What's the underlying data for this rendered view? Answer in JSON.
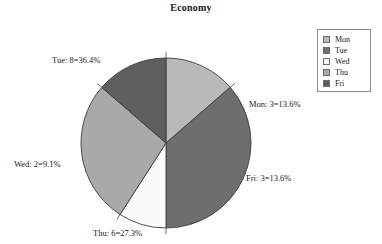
{
  "chart_data": {
    "type": "pie",
    "title": "Economy",
    "categories": [
      "Mon",
      "Tue",
      "Wed",
      "Thu",
      "Fri"
    ],
    "values": [
      3,
      8,
      2,
      6,
      3
    ],
    "percents": [
      13.6,
      36.4,
      9.1,
      27.3,
      13.6
    ],
    "total": 22,
    "colors": [
      "#b9b9b9",
      "#6e6e6e",
      "#fbfbfb",
      "#a9a9a9",
      "#5f5f5f"
    ],
    "start_angle_deg": 0,
    "direction": "clockwise",
    "legend_position": "top-right",
    "grid": false,
    "xlabel": "",
    "ylabel": "",
    "slice_labels": [
      "Mon: 3=13.6%",
      "Tue: 8=36.4%",
      "Wed: 2=9.1%",
      "Thu: 6=27.3%",
      "Fri: 3=13.6%"
    ]
  },
  "title": "Economy",
  "labels": {
    "mon": "Mon: 3=13.6%",
    "tue": "Tue: 8=36.4%",
    "wed": "Wed: 2=9.1%",
    "thu": "Thu: 6=27.3%",
    "fri": "Fri: 3=13.6%"
  },
  "legend": {
    "items": [
      {
        "label": "Mon",
        "color": "#b9b9b9"
      },
      {
        "label": "Tue",
        "color": "#6e6e6e"
      },
      {
        "label": "Wed",
        "color": "#fbfbfb"
      },
      {
        "label": "Thu",
        "color": "#a9a9a9"
      },
      {
        "label": "Fri",
        "color": "#5f5f5f"
      }
    ]
  }
}
